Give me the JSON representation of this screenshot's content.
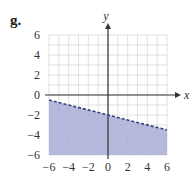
{
  "panel": {
    "label": "g."
  },
  "colors": {
    "shade": "#a9acd6",
    "grid": "#d9d9e0",
    "axis": "#333333",
    "boundary": "#3a3f7a"
  },
  "chart_data": {
    "type": "area",
    "title": "",
    "xlabel": "x",
    "ylabel": "y",
    "xlim": [
      -6,
      6
    ],
    "ylim": [
      -6,
      6
    ],
    "grid": true,
    "grid_step": 1,
    "x_ticks": [
      -6,
      -4,
      -2,
      0,
      2,
      4,
      6
    ],
    "y_ticks": [
      -6,
      -4,
      -2,
      0,
      2,
      4,
      6
    ],
    "x_tick_labels": [
      "−6",
      "−4",
      "−2",
      "0",
      "2",
      "4",
      "6"
    ],
    "y_tick_labels": [
      "−6",
      "−4",
      "−2",
      "0",
      "2",
      "4",
      "6"
    ],
    "boundary": {
      "equation": "y = -x/4 - 2",
      "style": "dashed",
      "points": [
        [
          -6,
          -0.5
        ],
        [
          6,
          -3.5
        ]
      ]
    },
    "shaded_region": "below boundary",
    "inequality": "y < -x/4 - 2"
  }
}
